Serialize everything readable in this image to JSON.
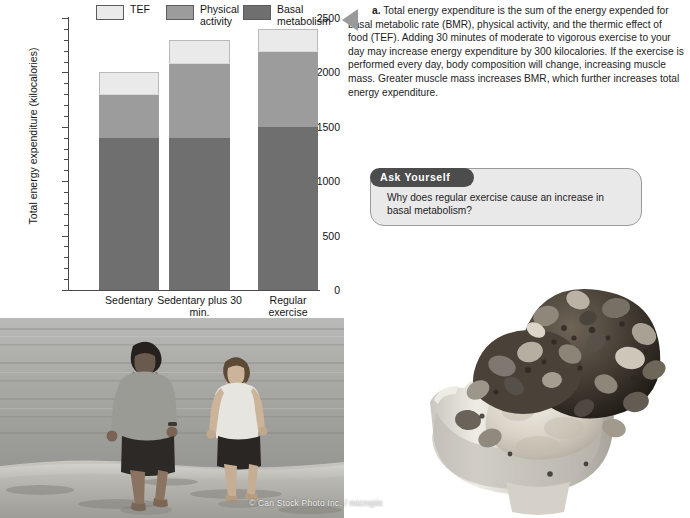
{
  "chart_data": {
    "type": "bar",
    "stacked": true,
    "title": "",
    "xlabel": "",
    "ylabel": "Total energy expenditure (kilocalories)",
    "ylim": [
      0,
      2500
    ],
    "ytick_values": [
      0,
      500,
      1000,
      1500,
      2000,
      2500
    ],
    "ytick_labels": [
      "0",
      "500",
      "1000",
      "1500",
      "2000",
      "2500"
    ],
    "minor_tick_step": 100,
    "grid": false,
    "legend_position": "top",
    "categories": [
      "Sedentary",
      "Sedentary plus 30 min.\nof moderate activity",
      "Regular\nexercise"
    ],
    "series": [
      {
        "name": "Basal metabolism",
        "color": "#6f6f6f",
        "values": [
          1400,
          1400,
          1500
        ]
      },
      {
        "name": "Physical activity",
        "color": "#9c9c9c",
        "values": [
          400,
          690,
          700
        ]
      },
      {
        "name": "TEF",
        "color": "#eaeaea",
        "values": [
          200,
          210,
          200
        ]
      }
    ],
    "totals": [
      2000,
      2300,
      2400
    ],
    "legend": [
      {
        "label": "TEF",
        "color": "#eaeaea"
      },
      {
        "label": "Physical\nactivity",
        "color": "#9c9c9c"
      },
      {
        "label": "Basal\nmetabolism",
        "color": "#6f6f6f"
      }
    ]
  },
  "caption": {
    "marker": "a.",
    "text": "a. Total energy expenditure is the sum of the energy expended for basal metabolic rate (BMR), physical activity, and the thermic effect of food (TEF). Adding 30 minutes of moderate to vigorous exercise to your day may increase energy expenditure by 300 kilocalories. If the exercise is performed every day, body composition will change, increasing muscle mass. Greater muscle mass increases BMR, which further increases total energy expenditure."
  },
  "ask_yourself": {
    "tab_label": "Ask Yourself",
    "question": "Why does regular exercise cause an increase in basal metabolism?"
  },
  "photos": {
    "runners_alt": "Two people jogging along the shoreline of a beach",
    "sundae_alt": "Ice cream sundae topped with chocolate pieces and nuts",
    "credit": "© Can Stock Photo Inc. / micropix"
  }
}
